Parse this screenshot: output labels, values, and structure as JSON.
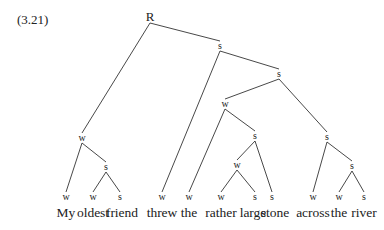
{
  "example_number": "(3.21)",
  "tree": {
    "nodes": [
      {
        "id": "R",
        "label": "R",
        "x": 150,
        "y": 16
      },
      {
        "id": "s1",
        "label": "s",
        "x": 220,
        "y": 46
      },
      {
        "id": "s2",
        "label": "s",
        "x": 279,
        "y": 74
      },
      {
        "id": "w1",
        "label": "w",
        "x": 225,
        "y": 104
      },
      {
        "id": "s3",
        "label": "s",
        "x": 255,
        "y": 136
      },
      {
        "id": "w2",
        "label": "w",
        "x": 237,
        "y": 165
      },
      {
        "id": "s4",
        "label": "s",
        "x": 327,
        "y": 137
      },
      {
        "id": "s5",
        "label": "s",
        "x": 352,
        "y": 166
      },
      {
        "id": "wL",
        "label": "w",
        "x": 82,
        "y": 138
      },
      {
        "id": "sL",
        "label": "s",
        "x": 106,
        "y": 167
      },
      {
        "id": "l1",
        "label": "w",
        "x": 66,
        "y": 197
      },
      {
        "id": "l2",
        "label": "w",
        "x": 93,
        "y": 197
      },
      {
        "id": "l3",
        "label": "s",
        "x": 120,
        "y": 197
      },
      {
        "id": "l4",
        "label": "w",
        "x": 162,
        "y": 197
      },
      {
        "id": "l5",
        "label": "w",
        "x": 189,
        "y": 197
      },
      {
        "id": "l6",
        "label": "w",
        "x": 221,
        "y": 197
      },
      {
        "id": "l7",
        "label": "s",
        "x": 255,
        "y": 197
      },
      {
        "id": "l8",
        "label": "s",
        "x": 272,
        "y": 197
      },
      {
        "id": "l9",
        "label": "w",
        "x": 313,
        "y": 197
      },
      {
        "id": "l10",
        "label": "w",
        "x": 339,
        "y": 197
      },
      {
        "id": "l11",
        "label": "s",
        "x": 364,
        "y": 197
      }
    ],
    "edges": [
      [
        "R",
        "s1"
      ],
      [
        "R",
        "wL"
      ],
      [
        "s1",
        "s2"
      ],
      [
        "s1",
        "l4"
      ],
      [
        "s2",
        "w1"
      ],
      [
        "s2",
        "s4"
      ],
      [
        "w1",
        "l5"
      ],
      [
        "w1",
        "s3"
      ],
      [
        "s3",
        "w2"
      ],
      [
        "s3",
        "l8"
      ],
      [
        "w2",
        "l6"
      ],
      [
        "w2",
        "l7"
      ],
      [
        "s4",
        "l9"
      ],
      [
        "s4",
        "s5"
      ],
      [
        "s5",
        "l10"
      ],
      [
        "s5",
        "l11"
      ],
      [
        "wL",
        "l1"
      ],
      [
        "wL",
        "sL"
      ],
      [
        "sL",
        "l2"
      ],
      [
        "sL",
        "l3"
      ]
    ]
  },
  "words": [
    {
      "text": "My",
      "x": 66
    },
    {
      "text": "oldest",
      "x": 93
    },
    {
      "text": "friend",
      "x": 122
    },
    {
      "text": "threw",
      "x": 162
    },
    {
      "text": "the",
      "x": 189
    },
    {
      "text": "rather",
      "x": 221
    },
    {
      "text": "large",
      "x": 253
    },
    {
      "text": "stone",
      "x": 275
    },
    {
      "text": "across",
      "x": 313
    },
    {
      "text": "the",
      "x": 339
    },
    {
      "text": "river",
      "x": 364
    }
  ]
}
